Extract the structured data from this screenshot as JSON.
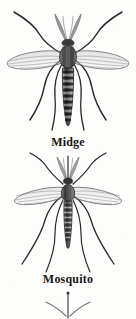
{
  "plate": {
    "name": "insect-comparison-plate",
    "background_color": "#fdfdfc",
    "ink_color": "#1a1a1a",
    "medium": "engraved line drawing, grayscale halftone scan"
  },
  "figures": [
    {
      "id": "midge",
      "caption": "Midge",
      "view": "dorsal",
      "features": {
        "antennae": "plumose (feathery), paired, held upright over head",
        "wings": "two, narrow, veined, held outspread horizontally",
        "abdomen": "long, segmented, boldly banded light and dark",
        "legs": "six, long, slender, front pair angled upward, rear pairs sweeping down and outward",
        "proboscis": "absent / non-piercing"
      }
    },
    {
      "id": "mosquito",
      "caption": "Mosquito",
      "view": "dorsal",
      "features": {
        "antennae": "plumose, paired, held upright",
        "wings": "two, long, narrow, scaled and veined, outspread wider than body",
        "abdomen": "slender, segmented, finely banded, tapering",
        "legs": "six, very long, slender, trailing down and outward",
        "proboscis": "long, straight, piercing, projecting forward"
      }
    },
    {
      "id": "partial-bottom",
      "caption": "",
      "view": "dorsal",
      "cropped": "true",
      "features": {
        "visible": "head, antennae and forelegs only; remainder cut off by bottom edge of plate"
      }
    }
  ],
  "captions": {
    "midge": "Midge",
    "mosquito": "Mosquito"
  }
}
